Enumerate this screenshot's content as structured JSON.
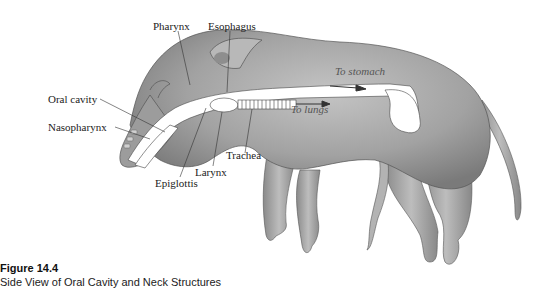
{
  "figure": {
    "number": "Figure 14.4",
    "caption": "Side View of Oral Cavity and Neck Structures"
  },
  "labels": {
    "pharynx": "Pharynx",
    "esophagus": "Esophagus",
    "oral_cavity": "Oral cavity",
    "nasopharynx": "Nasopharynx",
    "epiglottis": "Epiglottis",
    "larynx": "Larynx",
    "trachea": "Trachea",
    "to_stomach": "To stomach",
    "to_lungs": "To lungs"
  },
  "colors": {
    "body_fill": "#a9a9a9",
    "body_shade": "#7d7d7d",
    "passage": "#ffffff",
    "outline": "#444444",
    "leader": "#333333"
  }
}
